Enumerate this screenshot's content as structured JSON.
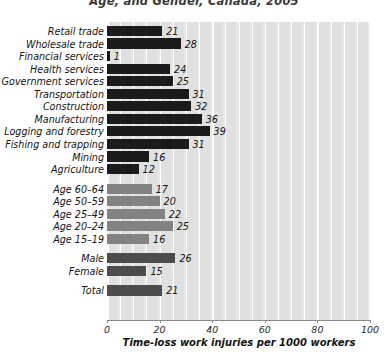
{
  "chart_data": {
    "type": "bar",
    "orientation": "horizontal",
    "title": "Age, and Gender, Canada, 2005",
    "xlabel": "Time-loss work injuries per 1000 workers",
    "ylabel": "",
    "xlim": [
      0,
      100
    ],
    "xticks": [
      0,
      20,
      40,
      60,
      80,
      100
    ],
    "xtick_labels": [
      "0",
      "20",
      "40",
      "60",
      "80",
      "100"
    ],
    "grid": true,
    "grid_axis": "x",
    "minor_grid_step": 5,
    "legend": "none",
    "categories": [
      "Retail trade",
      "Wholesale trade",
      "Financial services",
      "Health services",
      "Government services",
      "Transportation",
      "Construction",
      "Manufacturing",
      "Logging and forestry",
      "Fishing and trapping",
      "Mining",
      "Agriculture",
      "Age 60–64",
      "Age 50–59",
      "Age 25–49",
      "Age 20–24",
      "Age 15–19",
      "Male",
      "Female",
      "Total"
    ],
    "values": [
      21,
      28,
      1,
      24,
      25,
      31,
      32,
      36,
      39,
      31,
      16,
      12,
      17,
      20,
      22,
      25,
      16,
      26,
      15,
      21
    ],
    "value_labels": [
      "21",
      "28",
      "1",
      "24",
      "25",
      "31",
      "32",
      "36",
      "39",
      "31",
      "16",
      "12",
      "17",
      "20",
      "22",
      "25",
      "16",
      "26",
      "15",
      "21"
    ],
    "groups": [
      {
        "name": "industry",
        "start": 0,
        "count": 12,
        "color": "#1b1b1b"
      },
      {
        "name": "age",
        "start": 12,
        "count": 5,
        "color": "#828282"
      },
      {
        "name": "gender",
        "start": 17,
        "count": 2,
        "color": "#4c4c4c"
      },
      {
        "name": "total",
        "start": 19,
        "count": 1,
        "color": "#4c4c4c"
      }
    ]
  },
  "colors": {
    "industry_bar": "#1b1b1b",
    "age_bar": "#828282",
    "gender_bar": "#4c4c4c",
    "plot_background": "#e6e6e6",
    "band": "#e0e0e0",
    "gridline": "#ffffff",
    "axis": "#8a8a8a",
    "text": "#141414"
  }
}
